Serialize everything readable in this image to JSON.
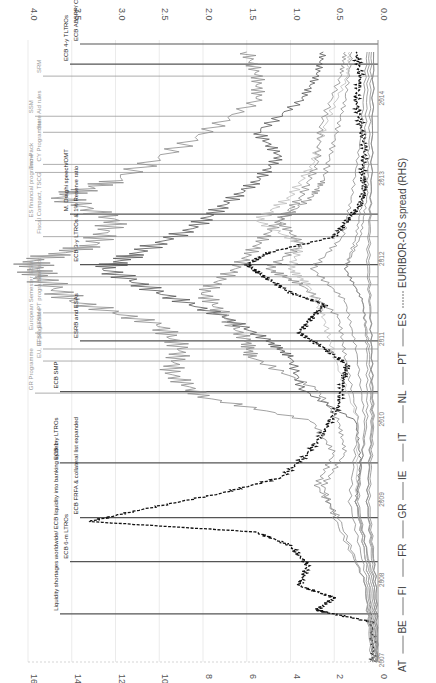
{
  "chart_data": {
    "type": "line",
    "orientation": "rotated-90",
    "title": "",
    "xlabel": "",
    "ylabel_left": "Sovereign spreads (LHS)",
    "ylabel_right": "EURIBOR-OIS spread (RHS)",
    "left_axis": {
      "ticks": [
        0,
        2,
        4,
        6,
        8,
        10,
        12,
        14,
        16
      ],
      "range": [
        0,
        16
      ]
    },
    "right_axis": {
      "ticks": [
        "0.0",
        "0.5",
        "1.0",
        "1.5",
        "2.0",
        "2.5",
        "3.0",
        "3.5",
        "4.0"
      ],
      "range": [
        0,
        4
      ]
    },
    "time_axis": {
      "ticks": [
        "2007",
        "2008",
        "2009",
        "2010",
        "2011",
        "2012",
        "2013",
        "2014"
      ]
    },
    "legend": [
      "AT",
      "BE",
      "FI",
      "FR",
      "GR",
      "IE",
      "IT",
      "NL",
      "PT",
      "ES",
      "EURIBOR-OIS spread (RHS)"
    ],
    "series": [
      {
        "name": "EURIBOR-OIS spread (RHS)",
        "style": "dashed-black",
        "x": [
          2007.0,
          2007.5,
          2007.62,
          2007.65,
          2007.8,
          2007.95,
          2008.2,
          2008.45,
          2008.62,
          2008.75,
          2008.9,
          2009.1,
          2009.3,
          2009.6,
          2009.9,
          2010.2,
          2010.5,
          2010.7,
          2010.9,
          2011.1,
          2011.3,
          2011.45,
          2011.6,
          2011.8,
          2011.95,
          2012.1,
          2012.3,
          2012.5,
          2012.7,
          2012.9,
          2013.1,
          2013.4,
          2013.7,
          2014.0,
          2014.3,
          2014.6
        ],
        "values": [
          0.05,
          0.07,
          0.6,
          0.7,
          0.5,
          0.9,
          0.8,
          1.0,
          1.4,
          3.3,
          2.7,
          1.8,
          1.1,
          0.8,
          0.6,
          0.45,
          0.4,
          0.35,
          0.6,
          0.9,
          0.75,
          0.6,
          1.0,
          1.3,
          1.5,
          1.25,
          0.5,
          0.35,
          0.2,
          0.15,
          0.18,
          0.15,
          0.2,
          0.25,
          0.2,
          0.25
        ]
      },
      {
        "name": "GR",
        "style": "gray",
        "x": [
          2007.0,
          2008.0,
          2008.8,
          2009.2,
          2009.6,
          2010.0,
          2010.3,
          2010.6,
          2010.9,
          2011.2,
          2011.5,
          2011.8,
          2012.0,
          2012.2,
          2012.5,
          2012.8,
          2013.0,
          2013.5,
          2014.0,
          2014.3,
          2014.6
        ],
        "values": [
          0.3,
          0.6,
          1.8,
          2.8,
          2.0,
          3.0,
          8.0,
          9.5,
          9.0,
          10.0,
          14.0,
          15.5,
          15.8,
          13.0,
          12.0,
          14.5,
          12.0,
          8.5,
          5.5,
          5.5,
          6.0
        ]
      },
      {
        "name": "PT",
        "style": "dark-gray",
        "x": [
          2007.0,
          2008.0,
          2009.0,
          2009.5,
          2010.0,
          2010.4,
          2010.8,
          2011.0,
          2011.3,
          2011.6,
          2011.9,
          2012.1,
          2012.4,
          2012.7,
          2013.0,
          2013.3,
          2013.6,
          2014.0,
          2014.3,
          2014.6
        ],
        "values": [
          0.2,
          0.4,
          1.0,
          0.8,
          1.0,
          3.5,
          4.0,
          5.0,
          7.0,
          10.0,
          12.5,
          11.0,
          8.5,
          7.0,
          5.5,
          4.5,
          5.5,
          3.5,
          2.8,
          2.5
        ]
      },
      {
        "name": "IE",
        "style": "gray",
        "x": [
          2007.0,
          2008.0,
          2008.8,
          2009.2,
          2009.6,
          2010.0,
          2010.4,
          2010.8,
          2011.0,
          2011.3,
          2011.6,
          2011.9,
          2012.2,
          2012.5,
          2012.8,
          2013.0,
          2013.5,
          2014.0,
          2014.6
        ],
        "values": [
          0.2,
          0.6,
          2.0,
          2.5,
          1.5,
          1.8,
          2.8,
          5.8,
          6.0,
          7.0,
          8.0,
          6.5,
          5.5,
          4.5,
          3.0,
          2.5,
          2.0,
          1.5,
          1.2
        ]
      },
      {
        "name": "IT",
        "style": "gray",
        "x": [
          2007.0,
          2008.0,
          2009.0,
          2010.0,
          2010.8,
          2011.3,
          2011.7,
          2011.9,
          2012.2,
          2012.5,
          2012.8,
          2013.2,
          2013.7,
          2014.3,
          2014.6
        ],
        "values": [
          0.2,
          0.5,
          1.3,
          0.9,
          1.5,
          1.8,
          3.5,
          5.0,
          3.5,
          4.5,
          3.5,
          2.8,
          2.6,
          1.7,
          1.5
        ]
      },
      {
        "name": "ES",
        "style": "light-gray",
        "x": [
          2007.0,
          2008.0,
          2009.0,
          2010.0,
          2010.8,
          2011.3,
          2011.7,
          2011.9,
          2012.2,
          2012.5,
          2012.8,
          2013.2,
          2013.7,
          2014.3,
          2014.6
        ],
        "values": [
          0.1,
          0.4,
          1.0,
          0.9,
          2.0,
          2.5,
          3.2,
          4.0,
          3.5,
          5.5,
          4.0,
          3.0,
          2.4,
          1.4,
          1.3
        ]
      },
      {
        "name": "BE",
        "style": "gray",
        "x": [
          2007.0,
          2008.0,
          2009.0,
          2010.0,
          2010.9,
          2011.5,
          2011.9,
          2012.3,
          2012.8,
          2013.5,
          2014.6
        ],
        "values": [
          0.1,
          0.3,
          0.9,
          0.6,
          1.0,
          1.5,
          3.0,
          1.6,
          1.2,
          0.8,
          0.5
        ]
      },
      {
        "name": "FR",
        "style": "gray",
        "x": [
          2007.0,
          2008.0,
          2009.0,
          2010.0,
          2010.9,
          2011.5,
          2011.9,
          2012.3,
          2012.8,
          2013.5,
          2014.6
        ],
        "values": [
          0.05,
          0.2,
          0.5,
          0.3,
          0.4,
          0.7,
          1.5,
          1.0,
          0.7,
          0.6,
          0.4
        ]
      },
      {
        "name": "AT",
        "style": "gray",
        "x": [
          2007.0,
          2008.0,
          2009.0,
          2010.0,
          2010.9,
          2011.5,
          2011.9,
          2012.3,
          2012.8,
          2013.5,
          2014.6
        ],
        "values": [
          0.05,
          0.2,
          1.0,
          0.5,
          0.5,
          0.7,
          1.5,
          0.8,
          0.5,
          0.4,
          0.3
        ]
      },
      {
        "name": "FI",
        "style": "gray",
        "x": [
          2007.0,
          2008.0,
          2009.0,
          2010.0,
          2011.0,
          2012.0,
          2013.0,
          2014.6
        ],
        "values": [
          0.0,
          0.1,
          0.4,
          0.2,
          0.3,
          0.4,
          0.3,
          0.2
        ]
      },
      {
        "name": "NL",
        "style": "gray",
        "x": [
          2007.0,
          2008.0,
          2009.0,
          2010.0,
          2011.0,
          2012.0,
          2013.0,
          2014.6
        ],
        "values": [
          0.0,
          0.1,
          0.5,
          0.25,
          0.3,
          0.5,
          0.3,
          0.2
        ]
      }
    ],
    "annotations": [
      {
        "label": "Liquidity shortages worldwide/ ECB liquidity into banking system",
        "date": 2007.6,
        "kind": "ECB"
      },
      {
        "label": "ECB 6-m LTROs",
        "date": 2008.25,
        "kind": "ECB"
      },
      {
        "label": "ECB FRFA & collateral list expanded",
        "date": 2008.8,
        "kind": "ECB"
      },
      {
        "label": "ECB 1-y LTROs",
        "date": 2009.48,
        "kind": "ECB"
      },
      {
        "label": "GR Programme",
        "date": 2010.35,
        "kind": "programme"
      },
      {
        "label": "IE programme",
        "date": 2010.9,
        "kind": "programme"
      },
      {
        "label": "ECB SMP",
        "date": 2010.37,
        "kind": "ECB"
      },
      {
        "label": "EU, EFSF, EFSM",
        "date": 2010.75,
        "kind": "policy"
      },
      {
        "label": "ESRB and ESAs",
        "date": 2011.0,
        "kind": "ECB"
      },
      {
        "label": "PT programme",
        "date": 2011.35,
        "kind": "programme"
      },
      {
        "label": "European Semester",
        "date": 2011.1,
        "kind": "policy"
      },
      {
        "label": "ECB 3-y LTROs & 1% Reserve ratio",
        "date": 2011.95,
        "kind": "ECB"
      },
      {
        "label": "ESM",
        "date": 2011.8,
        "kind": "policy"
      },
      {
        "label": "Six-Pack",
        "date": 2011.7,
        "kind": "policy"
      },
      {
        "label": "ES financial programme",
        "date": 2012.5,
        "kind": "programme"
      },
      {
        "label": "Fiscal Compact, TSCG",
        "date": 2012.3,
        "kind": "policy"
      },
      {
        "label": "M. Draghi speech/OMT",
        "date": 2012.58,
        "kind": "ECB"
      },
      {
        "label": "CY Programme",
        "date": 2013.2,
        "kind": "programme"
      },
      {
        "label": "Two-Pack",
        "date": 2013.1,
        "kind": "policy"
      },
      {
        "label": "State Aid rules",
        "date": 2013.6,
        "kind": "policy"
      },
      {
        "label": "SSM",
        "date": 2013.8,
        "kind": "policy"
      },
      {
        "label": "SRM",
        "date": 2014.3,
        "kind": "policy"
      },
      {
        "label": "ECB 4-y TLTROs",
        "date": 2014.45,
        "kind": "ECB"
      },
      {
        "label": "ECB ABSPP/ CBPP3",
        "date": 2014.7,
        "kind": "ECB"
      }
    ],
    "grid": true,
    "legend_position": "bottom (rotated: right side)"
  }
}
